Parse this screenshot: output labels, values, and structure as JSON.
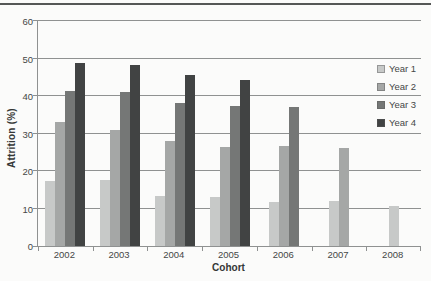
{
  "page": {
    "top_rule_color": "#555756"
  },
  "chart_data": {
    "type": "bar",
    "title": "",
    "xlabel": "Cohort",
    "ylabel": "Attrition (%)",
    "ylim": [
      0,
      60
    ],
    "yticks": [
      0,
      10,
      20,
      30,
      40,
      50,
      60
    ],
    "grid": true,
    "legend_position": "right",
    "categories": [
      "2002",
      "2003",
      "2004",
      "2005",
      "2006",
      "2007",
      "2008"
    ],
    "series": [
      {
        "name": "Year 1",
        "color": "#c7c9c8",
        "values": [
          17.4,
          17.6,
          13.3,
          13.0,
          11.8,
          12.1,
          10.8
        ]
      },
      {
        "name": "Year 2",
        "color": "#a5a7a6",
        "values": [
          33.2,
          31.0,
          27.9,
          26.3,
          26.7,
          26.1,
          null
        ]
      },
      {
        "name": "Year 3",
        "color": "#757776",
        "values": [
          41.3,
          41.2,
          38.1,
          37.3,
          37.0,
          null,
          null
        ]
      },
      {
        "name": "Year 4",
        "color": "#414343",
        "values": [
          48.8,
          48.3,
          45.5,
          44.2,
          null,
          null,
          null
        ]
      }
    ],
    "axis_color": "#8f9191",
    "gridline_color": "#8f9191",
    "tick_label_color": "#454746"
  }
}
